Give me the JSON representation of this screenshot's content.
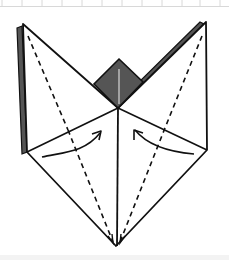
{
  "diagram": {
    "type": "origami-fold-step",
    "colors": {
      "outline": "#111111",
      "shade": "#555555",
      "highlight": "#bdbdbd",
      "grid": "#d8d8d8",
      "background": "#ffffff"
    },
    "elements": {
      "diamond": "shaded-center-diamond",
      "valley_lines": 4,
      "arrows": [
        "fold-arrow-left",
        "fold-arrow-right"
      ]
    }
  }
}
